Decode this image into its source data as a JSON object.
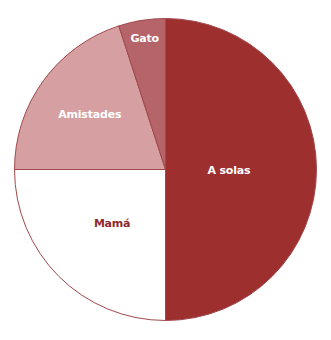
{
  "chart_data": {
    "type": "pie",
    "title": "",
    "start_angle_deg": 0,
    "direction": "clockwise_from_top",
    "slices": [
      {
        "label": "A solas",
        "value": 50,
        "color": "#9e2f2f",
        "label_color": "#ffffff"
      },
      {
        "label": "Mamá",
        "value": 25,
        "color": "#ffffff",
        "label_color": "#8e2a2e"
      },
      {
        "label": "Amistades",
        "value": 20,
        "color": "#d6a0a2",
        "label_color": "#ffffff"
      },
      {
        "label": "Gato",
        "value": 5,
        "color": "#b5646a",
        "label_color": "#ffffff"
      }
    ],
    "outline_color": "#a0484c",
    "legend": "none (labels placed inside slices)"
  },
  "labels": {
    "a_solas": "A solas",
    "mama": "Mamá",
    "amistades": "Amistades",
    "gato": "Gato"
  }
}
